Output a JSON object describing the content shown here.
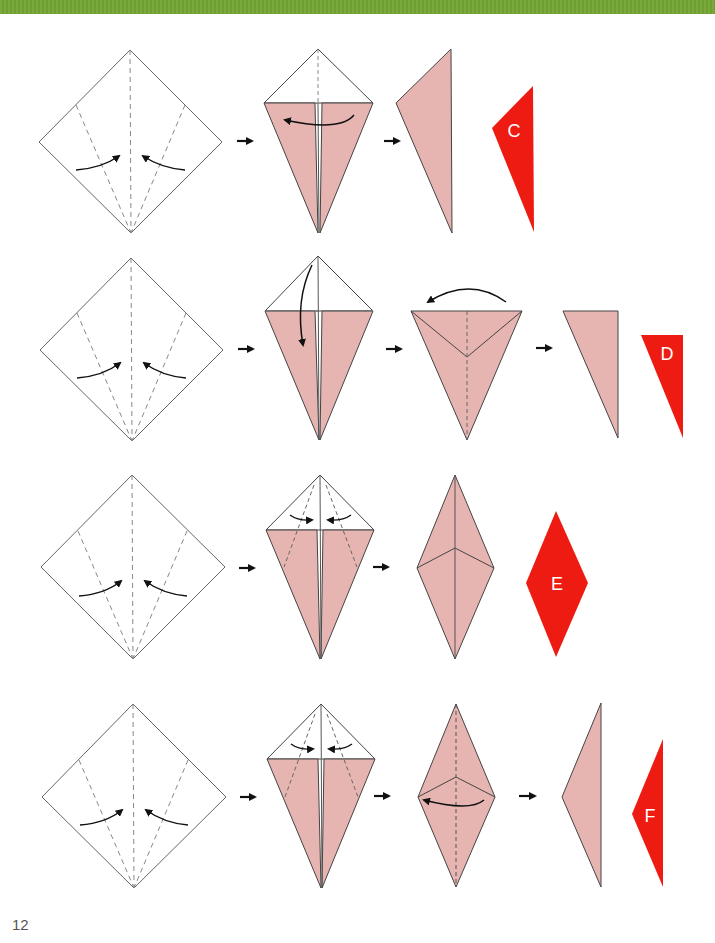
{
  "page": {
    "number": "12",
    "header_bar_color": "#74a536"
  },
  "colors": {
    "paper_back": "#ffffff",
    "paper_front": "#e6b5b1",
    "result_red": "#ee1b12",
    "line": "#333333",
    "dashed": "#888888"
  },
  "rows": [
    {
      "id": "row-c",
      "result_label": "C",
      "steps": 3
    },
    {
      "id": "row-d",
      "result_label": "D",
      "steps": 4
    },
    {
      "id": "row-e",
      "result_label": "E",
      "steps": 3
    },
    {
      "id": "row-f",
      "result_label": "F",
      "steps": 4
    }
  ],
  "labels": {
    "c": "C",
    "d": "D",
    "e": "E",
    "f": "F"
  }
}
